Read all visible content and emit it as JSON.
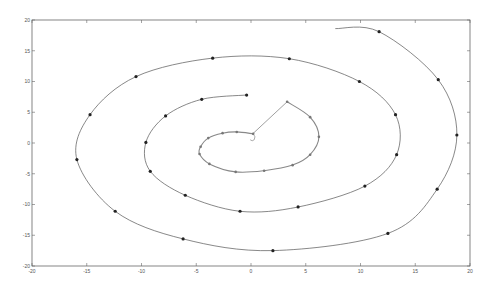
{
  "chart_data": {
    "type": "line",
    "title": "",
    "xlabel": "",
    "ylabel": "",
    "xlim": [
      -20,
      20
    ],
    "ylim": [
      -20,
      20
    ],
    "grid": false,
    "legend": null,
    "x_ticks": [
      -20,
      -15,
      -10,
      -5,
      0,
      5,
      10,
      15,
      20
    ],
    "y_ticks": [
      -20,
      -15,
      -10,
      -5,
      0,
      5,
      10,
      15,
      20
    ],
    "x_tick_labels": [
      "-20",
      "-15",
      "-10",
      "-5",
      "0",
      "5",
      "10",
      "15",
      "20"
    ],
    "y_tick_labels": [
      "-20",
      "-15",
      "-10",
      "-5",
      "0",
      "5",
      "10",
      "15",
      "20"
    ],
    "series": [
      {
        "name": "outer-spiral",
        "style": "line-with-dark-markers",
        "color": "#555555",
        "marker_color": "#222222",
        "markers": [
          [
            11.7,
            18.1
          ],
          [
            17.1,
            10.3
          ],
          [
            18.8,
            1.3
          ],
          [
            17.0,
            -7.5
          ],
          [
            12.5,
            -14.7
          ],
          [
            2.0,
            -17.5
          ],
          [
            -6.2,
            -15.6
          ],
          [
            -12.4,
            -11.1
          ],
          [
            -15.9,
            -2.7
          ],
          [
            -14.7,
            4.6
          ],
          [
            -10.5,
            10.8
          ],
          [
            -3.5,
            13.8
          ],
          [
            3.5,
            13.7
          ],
          [
            9.9,
            10.0
          ],
          [
            13.2,
            4.6
          ],
          [
            13.3,
            -1.9
          ],
          [
            10.4,
            -7.0
          ],
          [
            4.3,
            -10.4
          ],
          [
            -1.0,
            -11.1
          ],
          [
            -6.0,
            -8.5
          ],
          [
            -9.2,
            -4.6
          ],
          [
            -9.6,
            0.1
          ],
          [
            -7.8,
            4.4
          ],
          [
            -4.5,
            7.1
          ],
          [
            -0.4,
            7.8
          ]
        ],
        "path_end": [
          7.7,
          18.6
        ]
      },
      {
        "name": "inner-spiral",
        "style": "line-with-gray-markers",
        "color": "#888888",
        "marker_color": "#777777",
        "markers": [
          [
            3.3,
            6.7
          ],
          [
            5.4,
            4.2
          ],
          [
            6.2,
            1.0
          ],
          [
            5.4,
            -1.9
          ],
          [
            3.8,
            -3.6
          ],
          [
            1.2,
            -4.5
          ],
          [
            -1.4,
            -4.7
          ],
          [
            -3.8,
            -3.4
          ],
          [
            -4.7,
            -1.8
          ],
          [
            -4.6,
            -0.6
          ],
          [
            -3.9,
            0.8
          ],
          [
            -2.6,
            1.6
          ],
          [
            -1.3,
            1.8
          ],
          [
            0.2,
            1.5
          ]
        ]
      },
      {
        "name": "radius-segment",
        "style": "line",
        "color": "#777777",
        "points": [
          [
            0.1,
            1.4
          ],
          [
            3.3,
            6.7
          ]
        ]
      }
    ],
    "spiral_model": {
      "center": [
        0,
        0
      ],
      "x_scale": 1.06,
      "y_scale": 0.98,
      "theta_start_deg": 60,
      "turns": 3.05,
      "r_per_radian": 1.02
    }
  },
  "theme": {
    "axis_color": "#666666",
    "background": "#ffffff",
    "frame_color": "#666666"
  }
}
